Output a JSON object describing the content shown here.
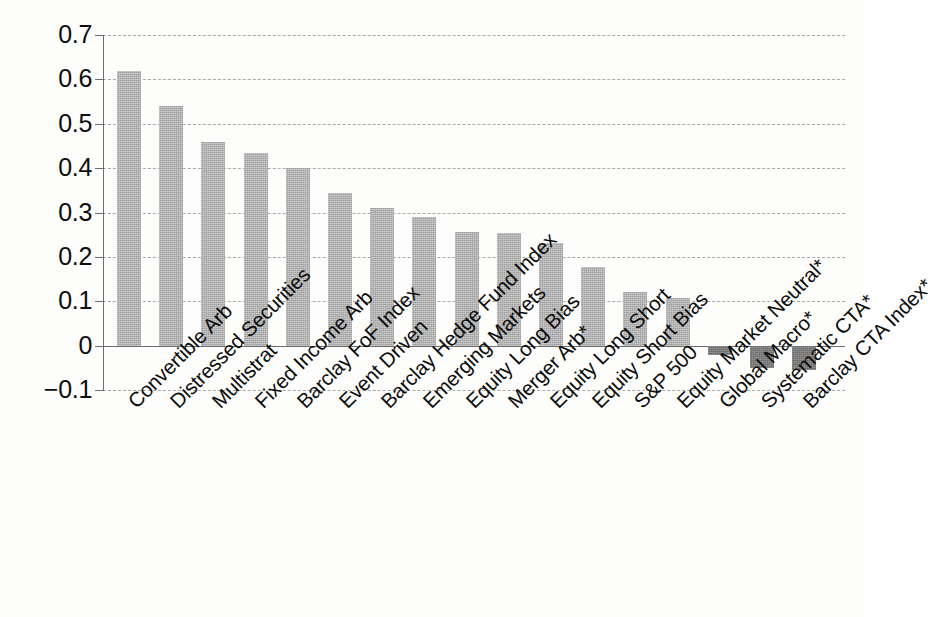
{
  "chart_data": {
    "type": "bar",
    "title": "",
    "subtitle": "",
    "xlabel": "",
    "ylabel": "",
    "grid": true,
    "legend": "none",
    "ylim": [
      -0.1,
      0.7
    ],
    "ytick_labels": [
      "0.7",
      "0.6",
      "0.5",
      "0.4",
      "0.3",
      "0.2",
      "0.1",
      "0",
      "−0.1"
    ],
    "ytick_values": [
      0.7,
      0.6,
      0.5,
      0.4,
      0.3,
      0.2,
      0.1,
      0,
      -0.1
    ],
    "categories": [
      "Convertible Arb",
      "Distressed Securities",
      "Multistrat",
      "Fixed Income Arb",
      "Barclay FoF Index",
      "Event Driven",
      "Barclay Hedge Fund Index",
      "Emerging Markets",
      "Equity Long Bias",
      "Merger Arb*",
      "Equity Long Short",
      "Equity Short Bias",
      "S&P 500",
      "Equity Market Neutral*",
      "Global Macro*",
      "Systematic CTA*",
      "Barclay CTA Index*"
    ],
    "values": [
      0.62,
      0.54,
      0.46,
      0.435,
      0.4,
      0.345,
      0.31,
      0.29,
      0.255,
      0.253,
      0.232,
      0.177,
      0.12,
      0.107,
      -0.02,
      -0.05,
      -0.055
    ],
    "bar_color_positive": "#9d9d9d",
    "bar_color_negative": "#6a6a6a",
    "gridline_color": "#a8a8a8",
    "axis_color": "#6d6d6d"
  },
  "caption": {
    "text": ""
  }
}
